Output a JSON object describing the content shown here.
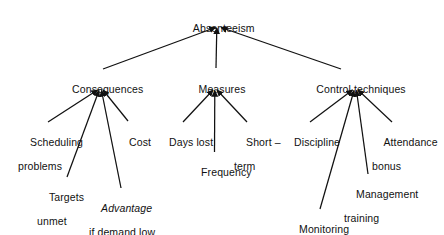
{
  "diagram": {
    "type": "tree",
    "title_node": "Absenteeism",
    "orientation": "top-down",
    "edge_color": "#111111",
    "text_color": "#111111",
    "background": "#ffffff",
    "nodes": {
      "root": {
        "label": "Absenteeism"
      },
      "consequences": {
        "label": "Consequences"
      },
      "measures": {
        "label": "Measures"
      },
      "control": {
        "label": "Control techniques"
      },
      "scheduling": {
        "line1": "Scheduling",
        "line2": "problems"
      },
      "cost": {
        "label": "Cost"
      },
      "targets": {
        "line1": "Targets",
        "line2": "unmet"
      },
      "advantage": {
        "line1": "Advantage",
        "line2": "if demand low"
      },
      "days_lost": {
        "label": "Days lost"
      },
      "frequency": {
        "label": "Frequency"
      },
      "short_term": {
        "line1": "Short –",
        "line2": "term"
      },
      "discipline": {
        "label": "Discipline"
      },
      "attendance": {
        "line1": "Attendance",
        "line2": "bonus"
      },
      "management": {
        "line1": "Management",
        "line2": "training"
      },
      "monitoring": {
        "label": "Monitoring"
      }
    }
  }
}
